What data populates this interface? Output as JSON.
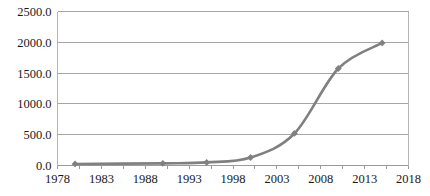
{
  "chart_data": {
    "type": "line",
    "title": "",
    "subtitle": "",
    "xlabel": "",
    "ylabel": "",
    "xlim": [
      1978,
      2018
    ],
    "ylim": [
      0,
      2500
    ],
    "grid": true,
    "legend": false,
    "legend_position": "none",
    "series_color": "#808080",
    "marker": "diamond",
    "x_tick_labels": [
      "1978",
      "1983",
      "1988",
      "1993",
      "1998",
      "2003",
      "2008",
      "2013",
      "2018"
    ],
    "x_ticks": [
      1978,
      1983,
      1988,
      1993,
      1998,
      2003,
      2008,
      2013,
      2018
    ],
    "y_tick_labels": [
      "0.0",
      "500.0",
      "1000.0",
      "1500.0",
      "2000.0",
      "2500.0"
    ],
    "y_ticks": [
      0,
      500,
      1000,
      1500,
      2000,
      2500
    ],
    "series": [
      {
        "name": "series-1",
        "x": [
          1980,
          1990,
          1995,
          2000,
          2005,
          2010,
          2015
        ],
        "values": [
          25,
          35,
          50,
          130,
          520,
          1575,
          1990
        ]
      }
    ]
  }
}
